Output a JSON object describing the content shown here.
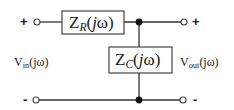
{
  "diagram": {
    "type": "circuit-schematic",
    "components": {
      "series_impedance": {
        "symbol": "Z",
        "subscript": "R",
        "arg_open": "(",
        "arg_j": "j",
        "arg_omega": "ω",
        "arg_close": ")"
      },
      "shunt_impedance": {
        "symbol": "Z",
        "subscript": "C",
        "arg_open": "(",
        "arg_j": "j",
        "arg_omega": "ω",
        "arg_close": ")"
      }
    },
    "ports": {
      "input": {
        "symbol": "V",
        "subscript": "in",
        "arg": "(jω)",
        "plus": "+",
        "minus": "-"
      },
      "output": {
        "symbol": "V",
        "subscript": "out",
        "arg": "(jω)",
        "plus": "+",
        "minus": "-"
      }
    },
    "colors": {
      "line": "#333333",
      "text": "#1a1a1a",
      "background": "#ffffff"
    }
  }
}
